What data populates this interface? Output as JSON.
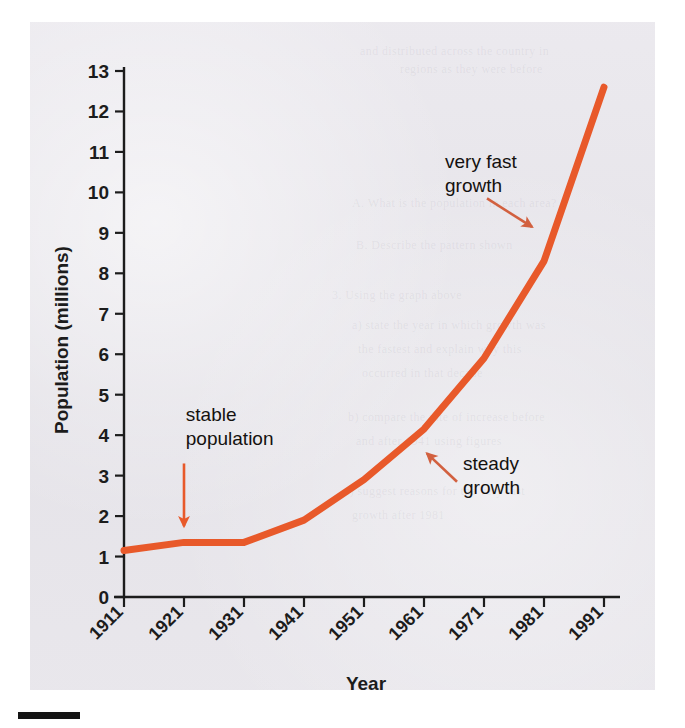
{
  "figure": {
    "background_color": "#e6e4e9",
    "page_color": "#ffffff",
    "rule_color": "#141414"
  },
  "chart_data": {
    "type": "line",
    "title": "",
    "xlabel": "Year",
    "ylabel": "Population (millions)",
    "xlim": [
      1911,
      1991
    ],
    "ylim": [
      0,
      13
    ],
    "grid": false,
    "legend": "none",
    "line_color": "#e8592a",
    "line_width": 7,
    "x": [
      1911,
      1921,
      1931,
      1941,
      1951,
      1961,
      1971,
      1981,
      1991
    ],
    "xtick_labels": [
      "1911",
      "1921",
      "1931",
      "1941",
      "1951",
      "1961",
      "1971",
      "1981",
      "1991"
    ],
    "xtick_rotation": 45,
    "ytick_labels": [
      "0",
      "1",
      "2",
      "3",
      "4",
      "5",
      "6",
      "7",
      "8",
      "9",
      "10",
      "11",
      "12",
      "13"
    ],
    "ytick_values": [
      0,
      1,
      2,
      3,
      4,
      5,
      6,
      7,
      8,
      9,
      10,
      11,
      12,
      13
    ],
    "series": [
      {
        "name": "Population",
        "values": [
          1.15,
          1.35,
          1.35,
          1.9,
          2.9,
          4.15,
          5.9,
          8.3,
          12.6
        ]
      }
    ],
    "annotations": [
      {
        "id": "stable-population",
        "text_lines": [
          "stable",
          "population"
        ],
        "text_x": 1921.3,
        "text_y": 4.35,
        "arrow_from": [
          1921.0,
          3.3
        ],
        "arrow_to": [
          1921.0,
          1.75
        ],
        "color": "#e8592a"
      },
      {
        "id": "steady-growth",
        "text_lines": [
          "steady",
          "growth"
        ],
        "text_x": 1967.5,
        "text_y": 3.15,
        "arrow_from": [
          1966.5,
          2.85
        ],
        "arrow_to": [
          1961.5,
          3.55
        ],
        "color": "#d2603f"
      },
      {
        "id": "very-fast-growth",
        "text_lines": [
          "very fast",
          "growth"
        ],
        "text_x": 1964.5,
        "text_y": 10.6,
        "arrow_from": [
          1971.5,
          9.85
        ],
        "arrow_to": [
          1979.0,
          9.15
        ],
        "color": "#d2603f"
      }
    ]
  },
  "bleed_text": [
    {
      "text": "and distributed across the country in",
      "x": 360,
      "y": 44
    },
    {
      "text": "regions as they were before",
      "x": 400,
      "y": 62
    },
    {
      "text": "A. What is the population in each area?",
      "x": 352,
      "y": 196
    },
    {
      "text": "B. Describe the pattern shown",
      "x": 356,
      "y": 238
    },
    {
      "text": "3. Using the graph above",
      "x": 332,
      "y": 288
    },
    {
      "text": "a) state the year in which growth was",
      "x": 352,
      "y": 318
    },
    {
      "text": "the fastest and explain why this",
      "x": 358,
      "y": 342
    },
    {
      "text": "occurred in that decade",
      "x": 362,
      "y": 366
    },
    {
      "text": "b) compare the rate of increase before",
      "x": 348,
      "y": 410
    },
    {
      "text": "and after 1941 using figures",
      "x": 356,
      "y": 434
    },
    {
      "text": "c) suggest reasons for the very fast",
      "x": 344,
      "y": 484
    },
    {
      "text": "growth after 1981",
      "x": 352,
      "y": 508
    }
  ]
}
